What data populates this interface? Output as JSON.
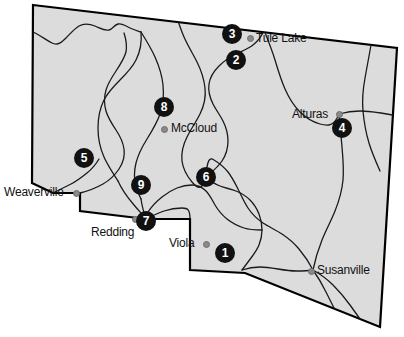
{
  "map": {
    "title": "Northern California region map",
    "fill_color": "#dcdcdc",
    "outline_color": "#000000",
    "county_line_color": "#1a1a1a",
    "marker_color": "#111111",
    "marker_text_color": "#ffffff",
    "city_dot_color": "#8a8a8a",
    "background_color": "#ffffff",
    "state_outline": "M33,5 L397,48 L380,327 L245,273 L190,270 L190,219 L146,219 L80,211 L80,193 L53,193 L32,183 Z",
    "county_lines": [
      "M33,32 C40,35 46,40 52,43 C58,46 62,42 66,38 C70,34 74,29 79,26 C84,23 90,24 95,26 C100,28 104,31 109,30 C113,29 114,25 118,24 C122,23 126,26 130,28 C134,30 138,31 141,32",
      "M141,32 C142,42 140,52 136,60 C132,68 126,74 120,80 C114,86 108,92 104,100 C100,108 98,118 98,128 C98,138 100,148 104,157 C108,166 113,173 118,181",
      "M118,181 C122,190 128,198 134,205 C139,211 143,215 146,219",
      "M141,32 C146,40 151,48 155,57 C159,66 162,75 163,85 C164,95 163,105 160,114 C157,123 152,131 147,139 C142,147 138,155 136,163 C134,171 134,179 136,186 C137,190 139,195 141,199",
      "M141,199 C142,206 144,213 146,219",
      "M174,8 C177,18 180,28 184,37 C188,46 193,54 197,62 C201,70 204,79 205,88 C206,97 204,106 200,114 C196,122 191,129 187,137 C183,145 181,153 182,161 C183,169 187,176 192,182 C197,188 202,192 206,177",
      "M206,177 C212,172 218,167 222,161 C226,155 228,148 228,141 C228,134 226,127 223,121 C220,115 216,110 213,104 C210,98 208,91 209,84 C210,77 214,71 219,66 C224,61 230,57 236,54 C242,51 248,49 253,45 C258,41 262,36 264,30",
      "M264,30 C268,40 272,50 275,60 C278,70 281,80 285,89 C289,98 294,106 300,112 C306,118 313,122 320,124 C327,126 334,127 339,114",
      "M339,114 C346,112 353,111 360,111 C367,111 374,112 381,113 C388,114 393,115 397,116",
      "M339,114 C340,125 341,136 342,147 C343,158 344,169 343,180 C342,191 339,201 335,211 C331,221 326,230 322,240 C318,250 315,260 313,270",
      "M313,270 C309,262 304,255 299,249 C294,243 288,238 282,234 C276,230 269,227 263,223 C257,219 252,214 248,208 C244,202 241,195 238,189 C235,183 232,177 228,172 C224,167 219,163 214,160 C210,157 207,159 206,177",
      "M206,177 C210,181 215,184 220,186 C225,188 231,189 236,191 C241,193 246,196 250,200 C254,204 257,209 259,214 C261,219 262,225 262,230 C262,235 261,240 259,245 C257,250 254,254 251,258 C248,262 245,266 242,270",
      "M242,270 C248,268 254,267 260,267 C266,267 272,268 278,269 C284,270 290,271 296,271 C302,271 307,271 313,270",
      "M313,270 C320,274 327,279 333,285 C339,291 345,298 350,305 C355,312 360,319 365,326",
      "M313,270 C318,277 322,284 326,292 C330,300 334,308 338,316",
      "M262,230 C256,230 250,230 244,228 C238,226 232,223 227,219 C222,215 218,210 215,205 C212,200 210,195 206,191 C202,187 197,185 192,185 C187,185 182,186 177,188 C172,190 167,193 162,197 C157,201 152,206 148,212 C146,215 146,217 146,219",
      "M371,45 C369,56 367,67 365,78 C363,89 362,100 363,111",
      "M363,111 C364,122 366,133 369,143 C372,153 376,162 380,171",
      "M80,193 C88,191 96,188 103,184 C110,180 115,175 119,169 C123,163 125,156 124,149 C123,142 120,136 116,130 C112,124 108,118 106,111 C104,104 104,97 106,90 C108,83 112,77 116,71 C120,65 124,59 126,52 C127,46 126,39 124,33",
      "M53,193 C59,190 65,187 71,184 C77,181 82,177 87,173 C92,169 96,164 99,159",
      "M146,219 C152,216 158,213 164,211 C170,209 176,208 182,208 C188,208 190,210 190,219"
    ],
    "cities": [
      {
        "name": "Tule Lake",
        "dot_x": 250,
        "dot_y": 38,
        "label_x": 256,
        "label_y": 32
      },
      {
        "name": "Alturas",
        "dot_x": 339,
        "dot_y": 114,
        "label_x": 292,
        "label_y": 108
      },
      {
        "name": "McCloud",
        "dot_x": 164,
        "dot_y": 129,
        "label_x": 171,
        "label_y": 122
      },
      {
        "name": "Weaverville",
        "dot_x": 76,
        "dot_y": 193,
        "label_x": 4,
        "label_y": 186
      },
      {
        "name": "Redding",
        "dot_x": 135,
        "dot_y": 219,
        "label_x": 91,
        "label_y": 226
      },
      {
        "name": "Viola",
        "dot_x": 206,
        "dot_y": 244,
        "label_x": 169,
        "label_y": 237
      },
      {
        "name": "Susanville",
        "dot_x": 311,
        "dot_y": 271,
        "label_x": 317,
        "label_y": 264
      }
    ],
    "markers": [
      {
        "number": "1",
        "x": 225,
        "y": 253
      },
      {
        "number": "2",
        "x": 236,
        "y": 60
      },
      {
        "number": "3",
        "x": 232,
        "y": 34
      },
      {
        "number": "4",
        "x": 342,
        "y": 128
      },
      {
        "number": "5",
        "x": 84,
        "y": 158
      },
      {
        "number": "6",
        "x": 206,
        "y": 177
      },
      {
        "number": "7",
        "x": 146,
        "y": 221
      },
      {
        "number": "8",
        "x": 164,
        "y": 107
      },
      {
        "number": "9",
        "x": 141,
        "y": 185
      }
    ]
  }
}
